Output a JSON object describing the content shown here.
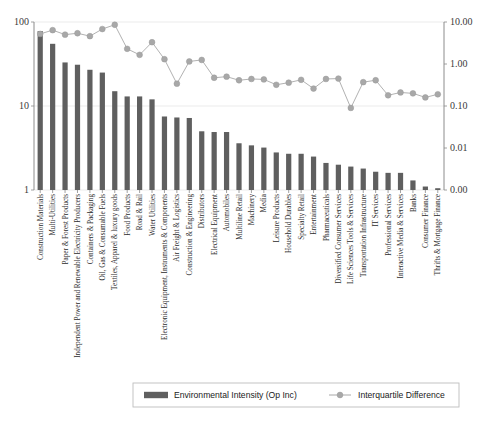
{
  "chart_data": {
    "type": "bar",
    "title": "",
    "xlabel": "",
    "ylabel": "",
    "y_left": {
      "scale": "log",
      "ticks": [
        "1",
        "10",
        "100"
      ],
      "tick_values": [
        1,
        10,
        100
      ],
      "ylim": [
        1,
        100
      ]
    },
    "y_right": {
      "scale": "log",
      "ticks": [
        "0.00",
        "0.01",
        "0.10",
        "1.00",
        "10.00"
      ],
      "tick_values": [
        0.001,
        0.01,
        0.1,
        1.0,
        10.0
      ],
      "ylim": [
        0.001,
        10.0
      ]
    },
    "grid": true,
    "legend_position": "bottom",
    "categories": [
      "Construction Materials",
      "Multi-Utilities",
      "Paper & Forest Products",
      "Independent Power and Renewable Electricity Producers",
      "Containers & Packaging",
      "Oil, Gas & Consumable Fuels",
      "Textiles, Apparel & luxury goods",
      "Food Products",
      "Road & Rail",
      "Water Utilities",
      "Electronic Equipment, Instruments & Components",
      "Air Freight & Logistics",
      "Construction & Engineering",
      "Distributors",
      "Electrical Equipment",
      "Automobiles",
      "Multiline Retail",
      "Machinery",
      "Media",
      "Leisure Products",
      "Household Durables",
      "Specialty Retail",
      "Entertainment",
      "Pharmaceuticals",
      "Diversified Consumer Services",
      "Life Sciences Tools & Services",
      "Transportation Infrastructure",
      "IT Services",
      "Professional Services",
      "Interactive Media & Services",
      "Banks",
      "Consumer Finance",
      "Thrifts & Mortgage Finance"
    ],
    "series": [
      {
        "name": "Environmental Intensity (Op Inc)",
        "type": "bar",
        "axis": "left",
        "color": "#5f5f5f",
        "values": [
          78,
          55,
          33,
          31,
          27,
          25,
          15,
          13,
          13,
          12,
          7.5,
          7.3,
          7.2,
          5.0,
          4.9,
          4.9,
          3.6,
          3.4,
          3.2,
          2.8,
          2.7,
          2.7,
          2.5,
          2.1,
          2.0,
          1.9,
          1.8,
          1.65,
          1.6,
          1.6,
          1.3,
          1.1,
          1.05
        ]
      },
      {
        "name": "Interquartile Difference",
        "type": "line",
        "axis": "right",
        "color": "#a8a8a8",
        "marker": "circle",
        "values": [
          5.2,
          6.4,
          5.0,
          5.4,
          4.6,
          6.8,
          8.6,
          2.3,
          1.65,
          3.3,
          1.3,
          0.34,
          1.15,
          1.25,
          0.47,
          0.5,
          0.41,
          0.44,
          0.43,
          0.32,
          0.36,
          0.42,
          0.26,
          0.44,
          0.45,
          0.09,
          0.37,
          0.41,
          0.18,
          0.21,
          0.2,
          0.16,
          0.19
        ]
      }
    ],
    "legend": [
      {
        "label": "Environmental Intensity (Op Inc)",
        "marker": "bar-swatch",
        "color": "#5f5f5f"
      },
      {
        "label": "Interquartile Difference",
        "marker": "line-circle",
        "color": "#a8a8a8"
      }
    ]
  }
}
